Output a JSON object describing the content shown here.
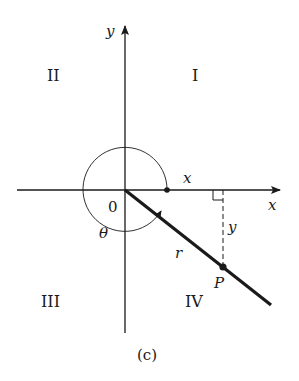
{
  "diagram": {
    "caption": "(c)",
    "axes": {
      "x_label": "x",
      "y_label": "y",
      "origin_label": "0"
    },
    "quadrants": {
      "q1": "I",
      "q2": "II",
      "q3": "III",
      "q4": "IV"
    },
    "labels": {
      "angle": "θ",
      "radius": "r",
      "point": "P",
      "x_segment": "x",
      "y_segment": "y"
    },
    "colors": {
      "ink": "#1a1a1a",
      "background": "#ffffff"
    }
  }
}
